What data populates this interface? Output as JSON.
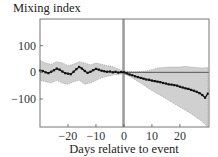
{
  "chart_data": {
    "type": "line",
    "title": "",
    "ylabel": "Mixing index",
    "xlabel": "Days relative to event",
    "xlim": [
      -30,
      30.4
    ],
    "ylim": [
      -205,
      200
    ],
    "xticks": [
      -20,
      -10,
      0,
      10,
      20
    ],
    "xtick_labels": [
      "−20",
      "−10",
      "0",
      "10",
      "20"
    ],
    "yticks": [
      100,
      0,
      -100
    ],
    "ytick_labels": [
      "100",
      "0",
      "−100"
    ],
    "grid": false,
    "event_marker": {
      "x_start": -0.6,
      "x_end": 0.1,
      "color": "#9a9a9a"
    },
    "reference_line": {
      "y": 0,
      "from_x": 0,
      "color": "#555555"
    },
    "series": [
      {
        "name": "Mean mixing index",
        "color": "#111111",
        "x": [
          -30,
          -29,
          -28,
          -27,
          -26,
          -25,
          -24,
          -23,
          -22,
          -21,
          -20,
          -19,
          -18,
          -17,
          -16,
          -15,
          -14,
          -13,
          -12,
          -11,
          -10,
          -9,
          -8,
          -7,
          -6,
          -5,
          -4,
          -3,
          -2,
          -1,
          0,
          1,
          2,
          3,
          4,
          5,
          6,
          7,
          8,
          9,
          10,
          11,
          12,
          13,
          14,
          15,
          16,
          17,
          18,
          19,
          20,
          21,
          22,
          23,
          24,
          25,
          26,
          27,
          28,
          29,
          30
        ],
        "y": [
          7,
          5,
          0,
          -3,
          2,
          8,
          14,
          10,
          3,
          -3,
          -5,
          -7,
          2,
          12,
          20,
          14,
          5,
          -2,
          2,
          8,
          13,
          10,
          6,
          4,
          2,
          3,
          0,
          2,
          -1,
          1,
          0,
          -4,
          -8,
          -11,
          -15,
          -18,
          -21,
          -24,
          -27,
          -28,
          -31,
          -33,
          -35,
          -37,
          -40,
          -42,
          -45,
          -46,
          -48,
          -50,
          -54,
          -57,
          -60,
          -62,
          -66,
          -69,
          -73,
          -78,
          -85,
          -95,
          -80
        ]
      }
    ],
    "band": {
      "name": "Confidence band",
      "color": "#d0d0d0",
      "x": [
        -30,
        -28,
        -26,
        -24,
        -22,
        -20,
        -18,
        -16,
        -14,
        -12,
        -10,
        -8,
        -6,
        -4,
        -2,
        0,
        2,
        4,
        6,
        8,
        10,
        12,
        14,
        16,
        18,
        20,
        22,
        24,
        26,
        28,
        30
      ],
      "upper": [
        45,
        35,
        30,
        40,
        35,
        25,
        30,
        40,
        35,
        28,
        35,
        30,
        25,
        22,
        12,
        5,
        3,
        2,
        3,
        5,
        10,
        16,
        18,
        20,
        20,
        20,
        22,
        20,
        18,
        16,
        18
      ],
      "lower": [
        -30,
        -35,
        -40,
        -30,
        -40,
        -45,
        -35,
        -30,
        -45,
        -40,
        -30,
        -20,
        -15,
        -10,
        -8,
        -5,
        -15,
        -28,
        -40,
        -55,
        -68,
        -80,
        -92,
        -105,
        -118,
        -130,
        -142,
        -155,
        -170,
        -185,
        -205
      ]
    }
  }
}
